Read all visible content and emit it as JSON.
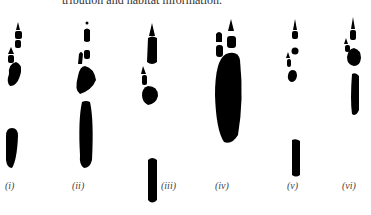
{
  "caption_fragment": "tribution and habitat information.",
  "figure": {
    "panels": [
      {
        "label": "(i)"
      },
      {
        "label": "(ii)"
      },
      {
        "label": "(iii)"
      },
      {
        "label": "(iv)"
      },
      {
        "label": "(v)"
      },
      {
        "label": "(vi)"
      }
    ],
    "ink_color": "#000000"
  }
}
